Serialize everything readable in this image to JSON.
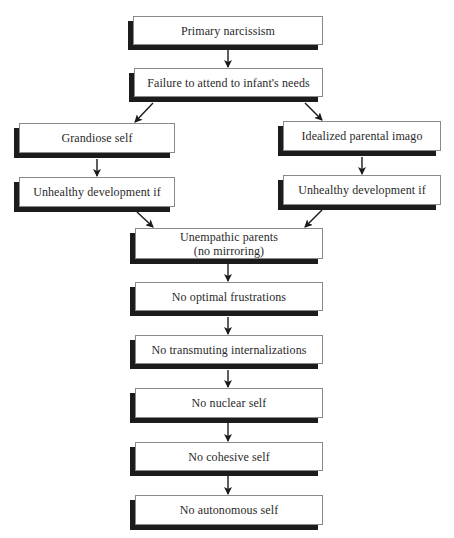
{
  "diagram": {
    "nodes": {
      "primary_narcissism": "Primary narcissism",
      "failure_to_attend": "Failure to attend to infant's needs",
      "grandiose_self": "Grandiose self",
      "unhealthy_left": "Unhealthy development if",
      "idealized_imago": "Idealized parental imago",
      "unhealthy_right": "Unhealthy development if",
      "unempathic_line1": "Unempathic parents",
      "unempathic_line2": "(no mirroring)",
      "no_optimal_frustrations": "No optimal frustrations",
      "no_transmuting": "No transmuting internalizations",
      "no_nuclear_self": "No nuclear self",
      "no_cohesive_self": "No cohesive self",
      "no_autonomous_self": "No autonomous self"
    },
    "edges": [
      [
        "Primary narcissism",
        "Failure to attend to infant's needs"
      ],
      [
        "Failure to attend to infant's needs",
        "Grandiose self"
      ],
      [
        "Failure to attend to infant's needs",
        "Idealized parental imago"
      ],
      [
        "Grandiose self",
        "Unhealthy development if"
      ],
      [
        "Idealized parental imago",
        "Unhealthy development if"
      ],
      [
        "Unhealthy development if",
        "Unempathic parents (no mirroring)"
      ],
      [
        "Unhealthy development if",
        "Unempathic parents (no mirroring)"
      ],
      [
        "Unempathic parents (no mirroring)",
        "No optimal frustrations"
      ],
      [
        "No optimal frustrations",
        "No transmuting internalizations"
      ],
      [
        "No transmuting internalizations",
        "No nuclear self"
      ],
      [
        "No nuclear self",
        "No cohesive self"
      ],
      [
        "No cohesive self",
        "No autonomous self"
      ]
    ],
    "colors": {
      "box_fill": "#ffffff",
      "box_border": "#8a8a8a",
      "shadow": "#1c1c1c",
      "arrow": "#1a1a1a",
      "text": "#2a2a2a"
    }
  }
}
